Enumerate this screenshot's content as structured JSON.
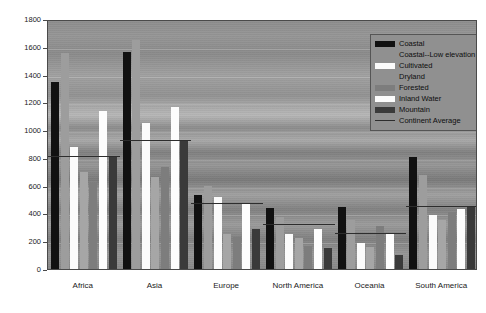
{
  "chart_data": {
    "type": "bar",
    "title": "",
    "xlabel": "",
    "ylabel": "",
    "ylim": [
      0,
      1800
    ],
    "ytick_step": 200,
    "yticks": [
      0,
      200,
      400,
      600,
      800,
      1000,
      1200,
      1400,
      1600,
      1800
    ],
    "grid": true,
    "legend_position": "top-right",
    "categories": [
      "Africa",
      "Asia",
      "Europe",
      "North America",
      "Oceania",
      "South America"
    ],
    "series": [
      {
        "name": "Coastal",
        "color": "#111111",
        "values": [
          1345,
          1565,
          535,
          440,
          450,
          805
        ]
      },
      {
        "name": "Coastal--Low elevation",
        "color": "#9d9d9d",
        "values": [
          1555,
          1650,
          600,
          375,
          350,
          680
        ]
      },
      {
        "name": "Cultivated",
        "color": "#fbfbfb",
        "values": [
          875,
          1050,
          520,
          250,
          190,
          390
        ]
      },
      {
        "name": "Dryland",
        "color": "#a6a6a6",
        "values": [
          695,
          665,
          255,
          225,
          155,
          350
        ]
      },
      {
        "name": "Forested",
        "color": "#7d7d7d",
        "values": [
          620,
          735,
          230,
          165,
          310,
          410
        ]
      },
      {
        "name": "Inland Water",
        "color": "#fdfdfd",
        "values": [
          1135,
          1165,
          470,
          290,
          250,
          435
        ]
      },
      {
        "name": "Mountain",
        "color": "#3a3a3a",
        "values": [
          805,
          925,
          290,
          150,
          100,
          445
        ]
      }
    ],
    "overlay": {
      "name": "Continent Average",
      "color": "#2d2d2d",
      "values": [
        805,
        925,
        470,
        320,
        250,
        445
      ]
    }
  },
  "legend": {
    "items": [
      {
        "label": "Coastal",
        "swatch": "solid",
        "color": "#111111"
      },
      {
        "label": "Coastal--Low elevation",
        "swatch": "none",
        "color": "#9d9d9d"
      },
      {
        "label": "Cultivated",
        "swatch": "solid",
        "color": "#fbfbfb"
      },
      {
        "label": "Dryland",
        "swatch": "none",
        "color": "#a6a6a6"
      },
      {
        "label": "Forested",
        "swatch": "solid",
        "color": "#7d7d7d"
      },
      {
        "label": "Inland Water",
        "swatch": "solid",
        "color": "#fdfdfd"
      },
      {
        "label": "Mountain",
        "swatch": "solid",
        "color": "#3a3a3a"
      },
      {
        "label": "Continent Average",
        "swatch": "line",
        "color": "#2d2d2d"
      }
    ]
  }
}
